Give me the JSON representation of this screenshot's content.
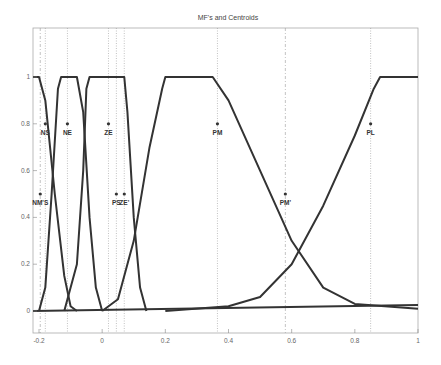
{
  "chart_data": {
    "type": "line",
    "title": "MF's and Centroids",
    "xlabel": "",
    "ylabel": "",
    "xlim": [
      -0.2,
      1
    ],
    "ylim": [
      -0.1,
      1.15
    ],
    "grid": false,
    "x_ticks": [
      "-0.2",
      "0",
      "0.2",
      "0.4",
      "0.6",
      "0.8",
      "1"
    ],
    "y_ticks": [
      "0",
      "0.2",
      "0.4",
      "0.6",
      "0.8",
      "1"
    ],
    "series": [
      {
        "name": "NS",
        "points": [
          [
            -0.22,
            1
          ],
          [
            -0.2,
            1
          ],
          [
            -0.18,
            0.9
          ],
          [
            -0.15,
            0.5
          ],
          [
            -0.12,
            0.15
          ],
          [
            -0.1,
            0.02
          ],
          [
            -0.08,
            0
          ]
        ]
      },
      {
        "name": "NE",
        "points": [
          [
            -0.2,
            0
          ],
          [
            -0.18,
            0.1
          ],
          [
            -0.16,
            0.5
          ],
          [
            -0.14,
            0.95
          ],
          [
            -0.13,
            1
          ],
          [
            -0.08,
            1
          ],
          [
            -0.06,
            0.85
          ],
          [
            -0.04,
            0.4
          ],
          [
            -0.02,
            0.1
          ],
          [
            0,
            0
          ]
        ]
      },
      {
        "name": "ZE",
        "points": [
          [
            -0.12,
            0
          ],
          [
            -0.08,
            0.2
          ],
          [
            -0.06,
            0.6
          ],
          [
            -0.05,
            0.95
          ],
          [
            -0.04,
            1
          ],
          [
            0.07,
            1
          ],
          [
            0.08,
            0.85
          ],
          [
            0.1,
            0.4
          ],
          [
            0.12,
            0.1
          ],
          [
            0.14,
            0
          ]
        ]
      },
      {
        "name": "PS",
        "points": [
          [
            0,
            0
          ],
          [
            0.05,
            0.05
          ],
          [
            0.1,
            0.3
          ],
          [
            0.15,
            0.7
          ],
          [
            0.19,
            0.95
          ],
          [
            0.2,
            1
          ],
          [
            0.35,
            1
          ],
          [
            0.4,
            0.9
          ],
          [
            0.5,
            0.6
          ],
          [
            0.6,
            0.3
          ],
          [
            0.7,
            0.1
          ],
          [
            0.8,
            0.03
          ],
          [
            1,
            0.01
          ]
        ]
      },
      {
        "name": "PM",
        "points": [
          [
            0.2,
            0
          ],
          [
            0.4,
            0.02
          ],
          [
            0.5,
            0.06
          ],
          [
            0.6,
            0.2
          ],
          [
            0.7,
            0.45
          ],
          [
            0.8,
            0.75
          ],
          [
            0.86,
            0.95
          ],
          [
            0.88,
            1
          ],
          [
            1,
            1
          ]
        ]
      }
    ],
    "centroids": [
      {
        "label": "NS",
        "x": -0.18,
        "y": 0.8
      },
      {
        "label": "NE",
        "x": -0.11,
        "y": 0.8
      },
      {
        "label": "ZE",
        "x": 0.02,
        "y": 0.8
      },
      {
        "label": "PM",
        "x": 0.365,
        "y": 0.8
      },
      {
        "label": "PL",
        "x": 0.85,
        "y": 0.8
      },
      {
        "label": "NM'S",
        "x": -0.196,
        "y": 0.5
      },
      {
        "label": "PS",
        "x": 0.045,
        "y": 0.5
      },
      {
        "label": "ZE'",
        "x": 0.07,
        "y": 0.5
      },
      {
        "label": "PM'",
        "x": 0.58,
        "y": 0.5
      }
    ],
    "vlines": [
      -0.196,
      -0.18,
      -0.11,
      0.02,
      0.045,
      0.07,
      0.365,
      0.58,
      0.85
    ],
    "legend": null
  }
}
